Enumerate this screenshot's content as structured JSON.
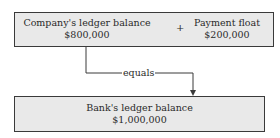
{
  "top_box": {
    "left": {
      "label": "Company's ledger balance",
      "value": "$800,000"
    },
    "operator": "+",
    "right": {
      "label": "Payment float",
      "value": "$200,000"
    }
  },
  "connector": {
    "label": "equals"
  },
  "bottom_box": {
    "label": "Bank's ledger balance",
    "value": "$1,000,000"
  }
}
